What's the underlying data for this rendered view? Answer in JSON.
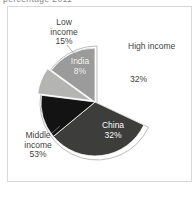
{
  "page": {
    "title_fragment": "percentage 2011"
  },
  "chart_data": {
    "type": "pie",
    "title_cropped": "percentage 2011",
    "start_angle_deg": 0,
    "direction": "clockwise",
    "legend_position": "none",
    "groups": [
      {
        "label": "High income",
        "value_pct": 32
      },
      {
        "label": "Middle income",
        "value_pct": 53
      },
      {
        "label": "Low income",
        "value_pct": 15
      }
    ],
    "slices": [
      {
        "label": "High income",
        "value_pct": 32,
        "color": "#ffffff",
        "stroke": false,
        "explode": 0,
        "label_position": "outside-right"
      },
      {
        "label": "China",
        "value_pct": 32,
        "color": "#3d3d3b",
        "stroke": true,
        "explode": 0,
        "label_position": "inside",
        "group": "Middle income"
      },
      {
        "label": "Middle income (other)",
        "value_pct": 13,
        "color": "#131313",
        "stroke": true,
        "explode": 0,
        "label_position": "outside-left",
        "group": "Middle income"
      },
      {
        "label": "India",
        "value_pct": 8,
        "color": "#b4b4b3",
        "stroke": true,
        "explode": 4,
        "label_position": "inside",
        "group": "Middle income"
      },
      {
        "label": "Low income",
        "value_pct": 15,
        "color": "#9b9b9b",
        "stroke": true,
        "explode": 0,
        "label_position": "outside-top"
      }
    ],
    "geometry": {
      "ring_cx": 97,
      "ring_cy": 103,
      "ring_r": 57,
      "ring_gap_start_deg": 0,
      "ring_gap_end_deg": 115.2,
      "pie_cx": 95,
      "pie_cy": 102,
      "pie_r": 54,
      "ring_stroke": "#a9a9a9",
      "slice_stroke": "#ffffff"
    },
    "leader_lines": [
      {
        "x1": 67,
        "y1": 45,
        "x2": 76,
        "y2": 56
      },
      {
        "x1": 52,
        "y1": 133,
        "x2": 60,
        "y2": 126
      }
    ]
  },
  "labels": {
    "low_income": {
      "line1": "Low",
      "line2": "income",
      "line3": "15%"
    },
    "high_income": {
      "name": "High income",
      "pct": "32%"
    },
    "india": {
      "name": "India",
      "pct": "8%"
    },
    "china": {
      "name": "China",
      "pct": "32%"
    },
    "middle_income": {
      "line1": "Middle",
      "line2": "income",
      "line3": "53%"
    }
  },
  "colors": {
    "panel_border": "#d8d8d8",
    "dark_text": "#3f3f3f",
    "title_text": "#8a8a8a"
  }
}
